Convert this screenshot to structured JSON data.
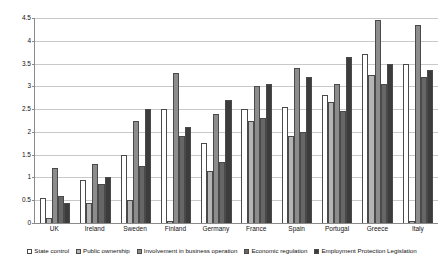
{
  "chart_data": {
    "type": "bar",
    "title": "",
    "subtitle": "",
    "xlabel": "",
    "ylabel": "",
    "ylim": [
      0,
      4.5
    ],
    "yticks": [
      0,
      0.5,
      1,
      1.5,
      2,
      2.5,
      3,
      3.5,
      4,
      4.5
    ],
    "ytick_labels": [
      "0",
      "0.5",
      "1",
      "1.5",
      "2",
      "2.5",
      "3",
      "3.5",
      "4",
      "4.5"
    ],
    "grid": true,
    "legend_position": "bottom",
    "categories": [
      "UK",
      "Ireland",
      "Sweden",
      "Finland",
      "Germany",
      "France",
      "Spain",
      "Portugal",
      "Greece",
      "Italy"
    ],
    "series": [
      {
        "name": "State control",
        "color": "#ffffff",
        "values": [
          0.55,
          0.95,
          1.5,
          2.5,
          1.75,
          2.5,
          2.55,
          2.8,
          3.7,
          3.5
        ]
      },
      {
        "name": "Public ownership",
        "color": "#b4b4b4",
        "values": [
          0.1,
          0.45,
          0.5,
          0.05,
          1.15,
          2.25,
          1.9,
          2.65,
          3.25,
          0.05
        ]
      },
      {
        "name": "Involvement in business operation",
        "color": "#8c8c8c",
        "values": [
          1.2,
          1.3,
          2.25,
          3.3,
          2.4,
          3.0,
          3.4,
          3.05,
          4.45,
          4.35
        ]
      },
      {
        "name": "Economic regulation",
        "color": "#666666",
        "values": [
          0.6,
          0.85,
          1.25,
          1.9,
          1.35,
          2.3,
          2.0,
          2.45,
          3.05,
          3.2
        ]
      },
      {
        "name": "Employment Protection Legislation",
        "color": "#3c3c3c",
        "values": [
          0.45,
          1.0,
          2.5,
          2.1,
          2.7,
          3.05,
          3.2,
          3.65,
          3.5,
          3.35
        ]
      }
    ]
  }
}
